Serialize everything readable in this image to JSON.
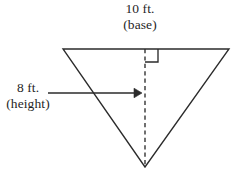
{
  "figure": {
    "background_color": "#ffffff",
    "stroke_color": "#2b2b2b",
    "text_color": "#1f1f1f",
    "base": {
      "value": "10 ft.",
      "name": "(base)"
    },
    "height": {
      "value": "8 ft.",
      "name": "(height)"
    },
    "shape": {
      "type": "triangle",
      "orientation": "inverted",
      "vertices": [
        {
          "x": 63,
          "y": 49
        },
        {
          "x": 229,
          "y": 49
        },
        {
          "x": 145,
          "y": 167
        }
      ]
    },
    "height_line": {
      "style": "dashed",
      "x": 145,
      "y_start": 49,
      "y_end": 167
    },
    "right_angle_marker": {
      "x": 145,
      "y": 49,
      "size": 13
    },
    "height_arrow": {
      "x_start": 48,
      "x_end": 142,
      "y": 93,
      "direction": "right"
    }
  }
}
